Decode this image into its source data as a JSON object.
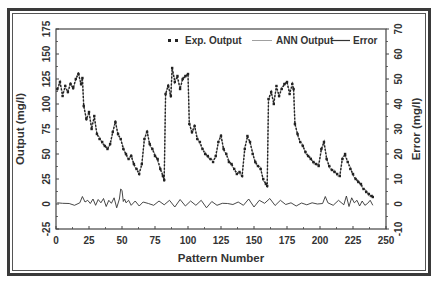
{
  "chart_data": {
    "type": "line",
    "title": "",
    "xlabel": "Pattern Number",
    "ylabel": "Output (mg/l)",
    "y2label": "Error (mg/l)",
    "xlim": [
      0,
      250
    ],
    "ylim": [
      -25,
      175
    ],
    "y2lim": [
      -10,
      70
    ],
    "xticks": [
      0,
      25,
      50,
      75,
      100,
      125,
      150,
      175,
      200,
      225,
      250
    ],
    "yticks": [
      -25,
      0,
      25,
      50,
      75,
      100,
      125,
      150,
      175
    ],
    "y2ticks": [
      -10,
      0,
      10,
      20,
      30,
      40,
      50,
      60,
      70
    ],
    "grid": false,
    "legend_position": "top-right inside",
    "series": [
      {
        "name": "Exp. Output",
        "style": "dashed-markers",
        "axis": "left",
        "x": [
          1,
          3,
          5,
          7,
          9,
          11,
          13,
          15,
          17,
          19,
          20,
          21,
          23,
          25,
          27,
          29,
          31,
          33,
          35,
          37,
          39,
          41,
          43,
          45,
          47,
          49,
          51,
          53,
          55,
          57,
          59,
          61,
          63,
          65,
          67,
          69,
          71,
          73,
          75,
          77,
          79,
          81,
          82,
          83,
          85,
          87,
          88,
          90,
          92,
          94,
          96,
          98,
          100,
          101,
          103,
          105,
          107,
          109,
          111,
          113,
          115,
          117,
          119,
          121,
          123,
          125,
          127,
          129,
          131,
          133,
          135,
          137,
          139,
          141,
          143,
          145,
          147,
          149,
          151,
          153,
          155,
          157,
          159,
          160,
          161,
          163,
          165,
          167,
          169,
          171,
          173,
          175,
          177,
          179,
          180,
          181,
          183,
          185,
          187,
          189,
          191,
          193,
          195,
          197,
          199,
          201,
          203,
          205,
          207,
          209,
          211,
          213,
          215,
          217,
          219,
          221,
          223,
          225,
          227,
          229,
          231,
          233,
          235,
          237,
          239,
          240
        ],
        "values": [
          115,
          122,
          108,
          118,
          112,
          120,
          116,
          125,
          130,
          120,
          126,
          98,
          85,
          92,
          75,
          88,
          70,
          65,
          62,
          58,
          55,
          60,
          72,
          82,
          70,
          65,
          55,
          50,
          45,
          48,
          40,
          35,
          30,
          40,
          65,
          72,
          60,
          55,
          48,
          45,
          35,
          28,
          24,
          110,
          118,
          108,
          136,
          122,
          128,
          115,
          125,
          128,
          130,
          80,
          72,
          78,
          65,
          62,
          55,
          50,
          48,
          45,
          42,
          48,
          62,
          68,
          55,
          50,
          42,
          40,
          35,
          30,
          32,
          28,
          55,
          68,
          62,
          50,
          42,
          38,
          35,
          25,
          20,
          18,
          105,
          112,
          100,
          118,
          108,
          115,
          120,
          122,
          110,
          120,
          115,
          80,
          70,
          62,
          58,
          52,
          48,
          45,
          42,
          40,
          38,
          55,
          62,
          45,
          38,
          34,
          32,
          30,
          28,
          45,
          50,
          42,
          35,
          30,
          25,
          22,
          20,
          15,
          12,
          10,
          8,
          7
        ]
      },
      {
        "name": "ANN Output",
        "style": "thin-line",
        "axis": "left",
        "note": "closely tracks Exp. Output"
      },
      {
        "name": "Error",
        "style": "solid-line",
        "axis": "right",
        "x": [
          1,
          5,
          10,
          14,
          18,
          20,
          22,
          24,
          26,
          28,
          30,
          32,
          34,
          36,
          38,
          40,
          42,
          44,
          46,
          48,
          49,
          50,
          51,
          52,
          53,
          55,
          57,
          60,
          63,
          66,
          70,
          74,
          78,
          82,
          86,
          90,
          94,
          98,
          102,
          106,
          110,
          114,
          118,
          122,
          126,
          130,
          134,
          138,
          142,
          146,
          150,
          154,
          158,
          162,
          166,
          170,
          174,
          178,
          182,
          186,
          190,
          194,
          198,
          202,
          204,
          206,
          210,
          214,
          218,
          220,
          222,
          224,
          226,
          228,
          230,
          232,
          234,
          236,
          238,
          240
        ],
        "values": [
          0.5,
          0.3,
          0.2,
          -0.5,
          0.5,
          3,
          0.8,
          1.5,
          0.2,
          2,
          -0.5,
          1.8,
          0.5,
          2.2,
          -1,
          1.5,
          0.3,
          2.5,
          -1.5,
          2,
          6,
          5.5,
          1,
          2,
          0.5,
          1.5,
          -0.5,
          1.2,
          -0.8,
          0.8,
          0.2,
          -0.5,
          1.2,
          -0.3,
          1.5,
          -1.2,
          1.8,
          -0.8,
          1.2,
          -0.5,
          1.5,
          -1.5,
          1,
          -0.5,
          0.3,
          0.2,
          -0.2,
          0.8,
          -0.5,
          2,
          -1.2,
          1.5,
          0.3,
          2.2,
          -0.6,
          1.5,
          -0.2,
          0.5,
          -0.8,
          0.4,
          -0.3,
          0.5,
          0,
          0.2,
          3,
          0.5,
          -0.5,
          1.5,
          -0.3,
          3.2,
          -1,
          2.5,
          0.5,
          1.5,
          -0.8,
          1.2,
          -0.5,
          0.2,
          1.5,
          -0.5
        ]
      }
    ],
    "legend": [
      {
        "label": "Exp. Output",
        "style": "dashed-markers"
      },
      {
        "label": "ANN Output",
        "style": "thin-line"
      },
      {
        "label": "Error",
        "style": "solid-line"
      }
    ]
  },
  "axes": {
    "x_title": "Pattern Number",
    "y_left_title": "Output (mg/l)",
    "y_right_title": "Error (mg/l)",
    "x_tick_labels": [
      "0",
      "25",
      "50",
      "75",
      "100",
      "125",
      "150",
      "175",
      "200",
      "225",
      "250"
    ],
    "y_left_tick_labels": [
      "-25",
      "0",
      "25",
      "50",
      "75",
      "100",
      "125",
      "150",
      "175"
    ],
    "y_right_tick_labels": [
      "-10",
      "0",
      "10",
      "20",
      "30",
      "40",
      "50",
      "60",
      "70"
    ]
  },
  "legend": {
    "exp_label": "Exp. Output",
    "ann_label": "ANN Output",
    "err_label": "Error"
  },
  "colors": {
    "exp": "#222222",
    "ann": "#777777",
    "error": "#333333",
    "axis": "#444444",
    "frame": "#3a3a3a"
  }
}
